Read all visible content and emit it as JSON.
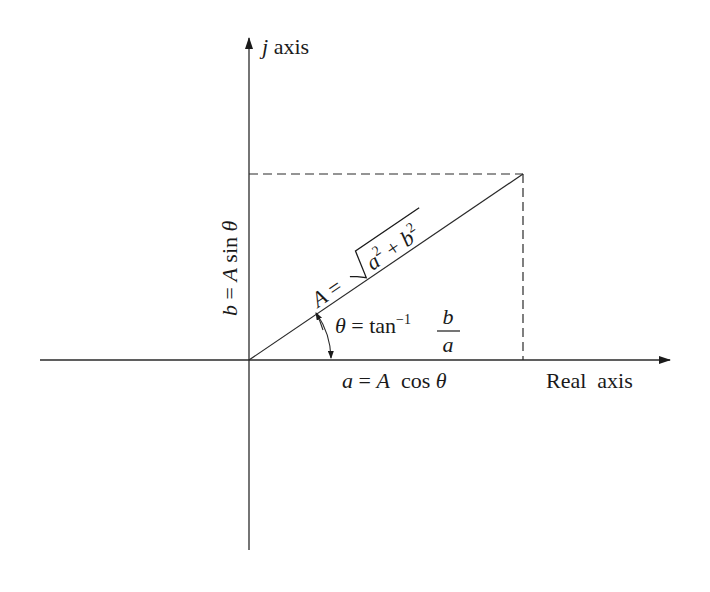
{
  "diagram": {
    "colors": {
      "ink": "#1a1a1a",
      "line": "#2a2a2a",
      "background": "#ffffff"
    },
    "axes": {
      "vertical_label_var": "j",
      "vertical_label_word": "axis",
      "horizontal_label": "Real  axis"
    },
    "labels": {
      "b_lhs": "b",
      "b_eq": " = ",
      "b_A": "A",
      "b_fn": " sin ",
      "b_theta": "θ",
      "a_lhs": "a",
      "a_eq": " = ",
      "a_A": "A",
      "a_fn": "  cos ",
      "a_theta": "θ",
      "mag_A": "A",
      "mag_eq": " =",
      "mag_a": "a",
      "mag_a_exp": "2",
      "mag_plus": " + ",
      "mag_b": "b",
      "mag_b_exp": "2",
      "angle_theta": "θ",
      "angle_eq": " = tan",
      "angle_exp": "−1",
      "frac_num": "b",
      "frac_den": "a"
    },
    "geometry": {
      "origin": [
        249,
        360
      ],
      "tip": [
        523,
        174
      ],
      "h_axis": [
        40,
        672
      ],
      "v_axis": [
        36,
        550
      ]
    }
  }
}
